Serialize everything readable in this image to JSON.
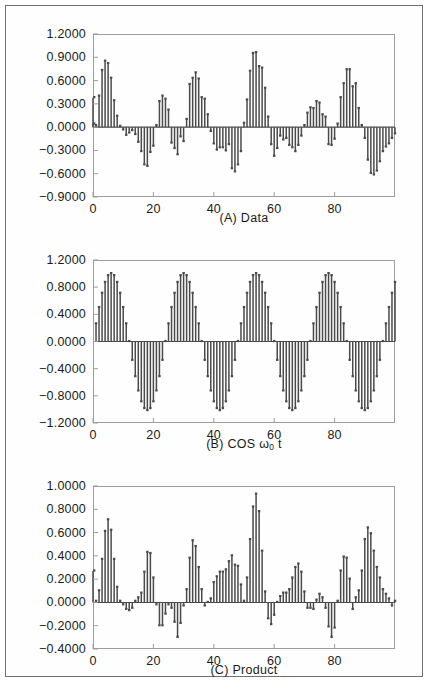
{
  "figure": {
    "border_color": "#6f7276",
    "background": "#ffffff",
    "bar_color": "#4a4a4a",
    "axis_color": "#9b9ea1",
    "text_color": "#1b1b1b"
  },
  "chart_data": [
    {
      "type": "bar",
      "id": "panel-a",
      "title": "(A) Data",
      "caption_plain": "(A) Data",
      "xlabel": "",
      "ylabel": "",
      "grid": false,
      "legend": "none",
      "ylim": [
        -0.9,
        1.2
      ],
      "xlim": [
        0,
        100
      ],
      "yticks": [
        1.2,
        0.9,
        0.6,
        0.3,
        0.0,
        -0.3,
        -0.6,
        -0.9
      ],
      "ytick_labels": [
        "1.2000",
        "0.9000",
        "0.6000",
        "0.3000",
        "0.0000",
        "-0.3000",
        "-0.6000",
        "-0.9000"
      ],
      "xticks": [
        0,
        20,
        40,
        60,
        80
      ],
      "xtick_labels": [
        "0",
        "20",
        "40",
        "60",
        "80"
      ],
      "x": [
        1,
        2,
        3,
        4,
        5,
        6,
        7,
        8,
        9,
        10,
        11,
        12,
        13,
        14,
        15,
        16,
        17,
        18,
        19,
        20,
        21,
        22,
        23,
        24,
        25,
        26,
        27,
        28,
        29,
        30,
        31,
        32,
        33,
        34,
        35,
        36,
        37,
        38,
        39,
        40,
        41,
        42,
        43,
        44,
        45,
        46,
        47,
        48,
        49,
        50,
        51,
        52,
        53,
        54,
        55,
        56,
        57,
        58,
        59,
        60,
        61,
        62,
        63,
        64,
        65,
        66,
        67,
        68,
        69,
        70,
        71,
        72,
        73,
        74,
        75,
        76,
        77,
        78,
        79,
        80,
        81,
        82,
        83,
        84,
        85,
        86,
        87,
        88,
        89,
        90,
        91,
        92,
        93,
        94,
        95,
        96,
        97,
        98,
        99,
        100
      ],
      "values": [
        0.02,
        0.4,
        0.73,
        0.85,
        0.82,
        0.63,
        0.34,
        0.14,
        0.01,
        -0.02,
        -0.09,
        -0.06,
        -0.03,
        -0.08,
        -0.18,
        -0.3,
        -0.47,
        -0.49,
        -0.31,
        -0.23,
        0.02,
        0.33,
        0.4,
        0.36,
        0.22,
        -0.19,
        -0.26,
        -0.34,
        -0.11,
        -0.17,
        0.1,
        0.55,
        0.63,
        0.7,
        0.62,
        0.38,
        0.36,
        0.16,
        -0.04,
        -0.2,
        -0.28,
        -0.25,
        -0.25,
        -0.29,
        -0.21,
        -0.52,
        -0.56,
        -0.47,
        -0.3,
        0.05,
        0.35,
        0.72,
        0.95,
        0.96,
        0.78,
        0.76,
        0.5,
        0.13,
        -0.21,
        -0.36,
        -0.26,
        -0.1,
        -0.15,
        -0.13,
        -0.22,
        -0.25,
        -0.3,
        -0.22,
        -0.1,
        0.02,
        0.18,
        0.25,
        0.24,
        0.33,
        0.31,
        0.16,
        0.13,
        -0.21,
        -0.22,
        -0.14,
        0.04,
        0.38,
        0.56,
        0.74,
        0.74,
        0.52,
        0.56,
        0.24,
        0.02,
        -0.13,
        -0.41,
        -0.58,
        -0.6,
        -0.55,
        -0.43,
        -0.3,
        -0.24,
        -0.2,
        -0.13,
        -0.07,
        0.04,
        0.38
      ]
    },
    {
      "type": "bar",
      "id": "panel-b",
      "title": "(B) COS w0 t",
      "caption_prefix": "(B)  COS ",
      "caption_symbol": "ω",
      "caption_sub": "0",
      "caption_suffix": "t",
      "caption_plain": "(B) COS ω₀t",
      "xlabel": "",
      "ylabel": "",
      "grid": false,
      "legend": "none",
      "ylim": [
        -1.2,
        1.2
      ],
      "xlim": [
        0,
        100
      ],
      "yticks": [
        1.2,
        0.8,
        0.4,
        0.0,
        -0.4,
        -0.8,
        -1.2
      ],
      "ytick_labels": [
        "1.2000",
        "0.8000",
        "0.4000",
        "0.0000",
        "-0.4000",
        "-0.8000",
        "-1.2000"
      ],
      "xticks": [
        0,
        20,
        40,
        60,
        80
      ],
      "xtick_labels": [
        "0",
        "20",
        "40",
        "60",
        "80"
      ],
      "period": 24,
      "amplitude": 1.0,
      "formula": "cos(2*pi*(n-6)/24)",
      "x": [
        1,
        2,
        3,
        4,
        5,
        6,
        7,
        8,
        9,
        10,
        11,
        12,
        13,
        14,
        15,
        16,
        17,
        18,
        19,
        20,
        21,
        22,
        23,
        24,
        25,
        26,
        27,
        28,
        29,
        30,
        31,
        32,
        33,
        34,
        35,
        36,
        37,
        38,
        39,
        40,
        41,
        42,
        43,
        44,
        45,
        46,
        47,
        48,
        49,
        50,
        51,
        52,
        53,
        54,
        55,
        56,
        57,
        58,
        59,
        60,
        61,
        62,
        63,
        64,
        65,
        66,
        67,
        68,
        69,
        70,
        71,
        72,
        73,
        74,
        75,
        76,
        77,
        78,
        79,
        80,
        81,
        82,
        83,
        84,
        85,
        86,
        87,
        88,
        89,
        90,
        91,
        92,
        93,
        94,
        95,
        96,
        97,
        98,
        99,
        100
      ],
      "values": [
        0.26,
        0.5,
        0.71,
        0.87,
        0.97,
        1.0,
        0.97,
        0.87,
        0.71,
        0.5,
        0.26,
        0.0,
        -0.26,
        -0.5,
        -0.71,
        -0.87,
        -0.97,
        -1.0,
        -0.97,
        -0.87,
        -0.71,
        -0.5,
        -0.26,
        0.0,
        0.26,
        0.5,
        0.71,
        0.87,
        0.97,
        1.0,
        0.97,
        0.87,
        0.71,
        0.5,
        0.26,
        0.0,
        -0.26,
        -0.5,
        -0.71,
        -0.87,
        -0.97,
        -1.0,
        -0.97,
        -0.87,
        -0.71,
        -0.5,
        -0.26,
        0.0,
        0.26,
        0.5,
        0.71,
        0.87,
        0.97,
        1.0,
        0.97,
        0.87,
        0.71,
        0.5,
        0.26,
        0.0,
        -0.26,
        -0.5,
        -0.71,
        -0.87,
        -0.97,
        -1.0,
        -0.97,
        -0.87,
        -0.71,
        -0.5,
        -0.26,
        0.0,
        0.26,
        0.5,
        0.71,
        0.87,
        0.97,
        1.0,
        0.97,
        0.87,
        0.71,
        0.5,
        0.26,
        0.0,
        -0.26,
        -0.5,
        -0.71,
        -0.87,
        -0.97,
        -1.0,
        -0.97,
        -0.87,
        -0.71,
        -0.5,
        -0.26,
        0.0,
        0.26,
        0.5,
        0.71,
        0.87
      ]
    },
    {
      "type": "bar",
      "id": "panel-c",
      "title": "(C) Product",
      "caption_plain": "(C) Product",
      "xlabel": "",
      "ylabel": "",
      "grid": false,
      "legend": "none",
      "ylim": [
        -0.4,
        1.0
      ],
      "xlim": [
        0,
        100
      ],
      "yticks": [
        1.0,
        0.8,
        0.6,
        0.4,
        0.2,
        0.0,
        -0.2,
        -0.4
      ],
      "ytick_labels": [
        "1.0000",
        "0.8000",
        "0.6000",
        "0.4000",
        "0.2000",
        "0.0000",
        "-0.2000",
        "-0.4000"
      ],
      "xticks": [
        0,
        20,
        40,
        60,
        80
      ],
      "xtick_labels": [
        "0",
        "20",
        "40",
        "60",
        "80"
      ],
      "derivation": "product of (A) and (B)",
      "x": [
        1,
        2,
        3,
        4,
        5,
        6,
        7,
        8,
        9,
        10,
        11,
        12,
        13,
        14,
        15,
        16,
        17,
        18,
        19,
        20,
        21,
        22,
        23,
        24,
        25,
        26,
        27,
        28,
        29,
        30,
        31,
        32,
        33,
        34,
        35,
        36,
        37,
        38,
        39,
        40,
        41,
        42,
        43,
        44,
        45,
        46,
        47,
        48,
        49,
        50,
        51,
        52,
        53,
        54,
        55,
        56,
        57,
        58,
        59,
        60,
        61,
        62,
        63,
        64,
        65,
        66,
        67,
        68,
        69,
        70,
        71,
        72,
        73,
        74,
        75,
        76,
        77,
        78,
        79,
        80,
        81,
        82,
        83,
        84,
        85,
        86,
        87,
        88,
        89,
        90,
        91,
        92,
        93,
        94,
        95,
        96,
        97,
        98,
        99,
        100
      ],
      "values": [
        0.01,
        0.1,
        0.37,
        0.61,
        0.71,
        0.62,
        0.37,
        0.13,
        0.01,
        -0.01,
        -0.05,
        -0.06,
        -0.04,
        0.01,
        0.04,
        0.08,
        0.26,
        0.43,
        0.42,
        0.21,
        -0.01,
        -0.19,
        -0.19,
        -0.09,
        -0.01,
        -0.04,
        -0.16,
        -0.29,
        -0.17,
        -0.02,
        0.11,
        0.38,
        0.53,
        0.48,
        0.3,
        0.11,
        -0.02,
        0.0,
        0.03,
        0.17,
        0.22,
        0.26,
        0.26,
        0.28,
        0.35,
        0.4,
        0.32,
        0.31,
        0.15,
        0.01,
        0.21,
        0.54,
        0.82,
        0.93,
        0.78,
        0.44,
        0.09,
        -0.13,
        -0.18,
        -0.1,
        0.0,
        0.05,
        0.08,
        0.08,
        0.11,
        0.21,
        0.3,
        0.33,
        0.26,
        0.09,
        -0.04,
        -0.04,
        -0.05,
        0.02,
        0.07,
        0.04,
        -0.04,
        -0.2,
        -0.29,
        -0.21,
        0.01,
        0.27,
        0.39,
        0.38,
        0.2,
        -0.05,
        0.04,
        0.1,
        0.27,
        0.54,
        0.64,
        0.59,
        0.44,
        0.3,
        0.21,
        0.11,
        0.07,
        0.03,
        -0.02,
        0.01,
        0.27
      ]
    }
  ]
}
